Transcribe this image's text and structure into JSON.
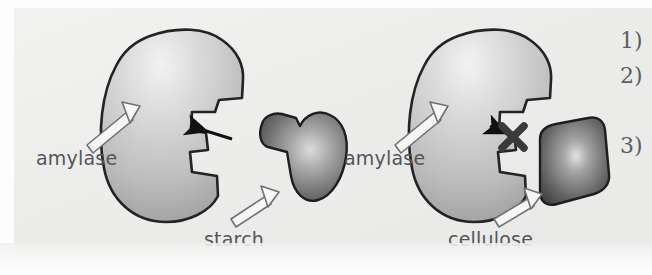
{
  "figure": {
    "background_color": "#eeeeed",
    "page_color": "#fdfdfd"
  },
  "colors": {
    "enzyme_fill_light": "#d8d8d8",
    "enzyme_fill_dark": "#9a9a9a",
    "enzyme_outline": "#232323",
    "substrate_fill_light": "#b9b9b9",
    "substrate_fill_dark": "#4a4a4a",
    "substrate_outline": "#1e1e1e",
    "label_text": "#55565a",
    "number_text": "#5c5d61",
    "reaction_arrow": "#111111",
    "cross_mark": "#3a3a3a",
    "pointer_fill": "#f6f6f5",
    "pointer_stroke": "#6f7073"
  },
  "panels": [
    {
      "id": "panel-fit",
      "name": "starch-fits-amylase",
      "enzyme": {
        "name": "amylase",
        "label": "amylase",
        "label_x": 36,
        "label_y": 147,
        "has_active_site_notch": true
      },
      "substrate": {
        "name": "starch",
        "label": "starch",
        "label_x": 204,
        "label_y": 228,
        "shape": "notched-blob",
        "complementary": true
      },
      "reaction_arrow": {
        "name": "substrate-to-active-site-arrow",
        "direction": "left",
        "blocked": false
      }
    },
    {
      "id": "panel-nofit",
      "name": "cellulose-does-not-fit-amylase",
      "enzyme": {
        "name": "amylase",
        "label": "amylase",
        "label_x": 344,
        "label_y": 147,
        "has_active_site_notch": true
      },
      "substrate": {
        "name": "cellulose",
        "label": "cellulose",
        "label_x": 448,
        "label_y": 228,
        "shape": "rounded-quadrilateral",
        "complementary": false
      },
      "reaction_arrow": {
        "name": "substrate-to-active-site-arrow",
        "direction": "left",
        "blocked": true,
        "block_symbol": "X"
      }
    }
  ],
  "list_markers": [
    {
      "label": "1)",
      "x": 620,
      "y": 28
    },
    {
      "label": "2)",
      "x": 620,
      "y": 63
    },
    {
      "label": "3)",
      "x": 620,
      "y": 133
    }
  ]
}
